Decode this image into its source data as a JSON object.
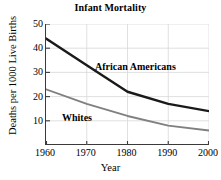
{
  "chart_data": {
    "type": "line",
    "title": "Infant Mortality",
    "xlabel": "Year",
    "ylabel": "Deaths per 1000 Live Births",
    "x": [
      1960,
      1970,
      1980,
      1990,
      2000
    ],
    "xticklabels": [
      "1960",
      "1970",
      "1980",
      "1990",
      "2000"
    ],
    "yticks": [
      10,
      20,
      30,
      40,
      50
    ],
    "yticklabels": [
      "10",
      "20",
      "30",
      "40",
      "50"
    ],
    "xlim": [
      1960,
      2000
    ],
    "ylim": [
      0,
      50
    ],
    "grid": true,
    "legend": "inline-annotations",
    "series": [
      {
        "name": "African Americans",
        "color": "#1a1a1a",
        "values": [
          44,
          33,
          22,
          17,
          14
        ]
      },
      {
        "name": "Whites",
        "color": "#808080",
        "values": [
          23,
          17,
          12,
          8,
          6
        ]
      }
    ],
    "annotations": [
      {
        "text": "African Americans",
        "series": "African Americans"
      },
      {
        "text": "Whites",
        "series": "Whites"
      }
    ]
  },
  "colors": {
    "axis": "#3a3a3a",
    "grid": "#d8d8d8",
    "background": "#ffffff",
    "african_americans": "#1a1a1a",
    "whites": "#808080"
  }
}
